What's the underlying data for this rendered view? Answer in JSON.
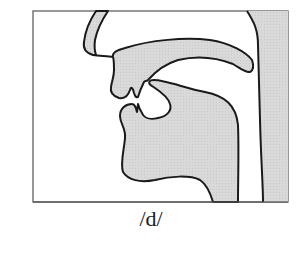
{
  "diagram": {
    "type": "sagittal-vocal-tract",
    "caption": "/d/",
    "colors": {
      "fill": "#d9d9d9",
      "stroke": "#1a1a1a",
      "frame": "#555555",
      "background": "#ffffff"
    },
    "parts": [
      "nose",
      "upper-lip",
      "palate",
      "tongue",
      "lower-jaw",
      "pharynx-wall"
    ]
  }
}
